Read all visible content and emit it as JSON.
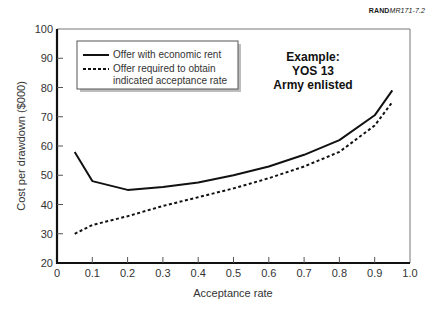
{
  "figure_id": {
    "prefix": "RAND",
    "suffix": "MR171-7.2"
  },
  "chart_data": {
    "type": "line",
    "title": "",
    "xlabel": "Acceptance rate",
    "ylabel": "Cost per drawdown ($000)",
    "xlim": [
      0,
      1.0
    ],
    "ylim": [
      20,
      100
    ],
    "grid": false,
    "x_ticks": [
      "0",
      "0.1",
      "0.2",
      "0.3",
      "0.4",
      "0.5",
      "0.6",
      "0.7",
      "0.8",
      "0.9",
      "1.0"
    ],
    "y_ticks": [
      "20",
      "30",
      "40",
      "50",
      "60",
      "70",
      "80",
      "90",
      "100"
    ],
    "legend_position": "upper left",
    "annotation": [
      "Example:",
      "YOS 13",
      "Army enlisted"
    ],
    "x": [
      0.05,
      0.1,
      0.2,
      0.3,
      0.4,
      0.5,
      0.6,
      0.7,
      0.8,
      0.9,
      0.95
    ],
    "series": [
      {
        "name": "Offer with economic rent",
        "style": "solid",
        "values": [
          58,
          48,
          45,
          46,
          47.5,
          50,
          53,
          57,
          62,
          70.5,
          79
        ]
      },
      {
        "name": "Offer required to obtain indicated acceptance rate",
        "style": "dashed",
        "values": [
          30,
          33,
          36,
          39.5,
          42.5,
          45.5,
          49,
          53,
          58,
          67,
          75
        ]
      }
    ]
  },
  "legend": {
    "items": [
      {
        "line1": "Offer with economic rent",
        "line2": ""
      },
      {
        "line1": "Offer required to obtain",
        "line2": "indicated acceptance rate"
      }
    ]
  },
  "annotation": {
    "line1": "Example:",
    "line2": "YOS 13",
    "line3": "Army enlisted"
  },
  "colors": {
    "line": "#111111",
    "axis": "#111111",
    "frame": "#777777",
    "text": "#333333"
  }
}
